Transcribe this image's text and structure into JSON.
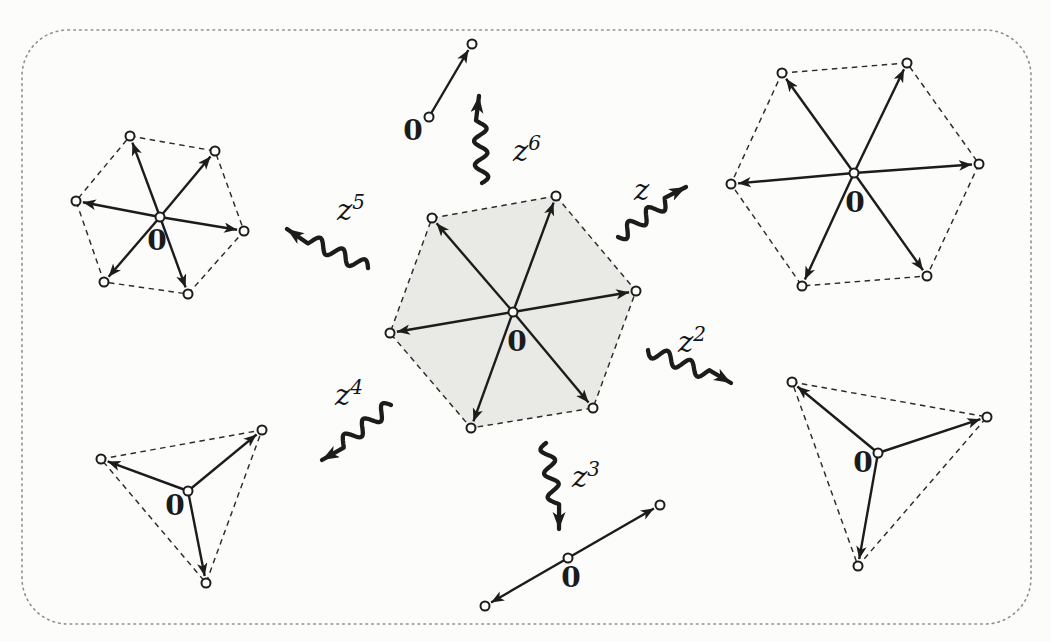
{
  "figure_title": "powers-of-z-mapping-diagram",
  "colors": {
    "page_background": "#fcfcfa",
    "ink": "#1c1c1c",
    "dash": "#2b2b2b",
    "border_dots": "#8f8f8f",
    "hexagon_shade": "#e9e9e6",
    "dot_fill": "#fcfcfa"
  },
  "border": {
    "x": 22,
    "y": 30,
    "width": 1009,
    "height": 594,
    "radius": 46
  },
  "shapes": [
    {
      "id": "domain-hexagon-shaded",
      "kind": "hexagon",
      "filled": true,
      "outline": true,
      "center": [
        513,
        312
      ],
      "zero": [
        517,
        351
      ],
      "zero_label": "0",
      "vertices": [
        [
          556,
          196
        ],
        [
          432,
          218
        ],
        [
          390,
          333
        ],
        [
          471,
          428
        ],
        [
          593,
          408
        ],
        [
          636,
          291
        ]
      ]
    },
    {
      "id": "image-hexagon-z",
      "kind": "hexagon",
      "filled": false,
      "outline": true,
      "center": [
        854,
        173
      ],
      "zero": [
        855,
        212
      ],
      "zero_label": "0",
      "vertices": [
        [
          782,
          73
        ],
        [
          907,
          63
        ],
        [
          979,
          164
        ],
        [
          927,
          276
        ],
        [
          802,
          286
        ],
        [
          731,
          184
        ]
      ]
    },
    {
      "id": "image-hexagon-z5",
      "kind": "hexagon",
      "filled": false,
      "outline": true,
      "center": [
        160,
        217
      ],
      "zero": [
        157,
        250
      ],
      "zero_label": "0",
      "vertices": [
        [
          130,
          136
        ],
        [
          215,
          151
        ],
        [
          244,
          231
        ],
        [
          188,
          294
        ],
        [
          104,
          282
        ],
        [
          76,
          201
        ]
      ]
    },
    {
      "id": "image-triangle-z4",
      "kind": "triangle",
      "filled": false,
      "outline": true,
      "center": [
        188,
        491
      ],
      "zero": [
        175,
        515
      ],
      "zero_label": "0",
      "vertices": [
        [
          101,
          459
        ],
        [
          262,
          430
        ],
        [
          206,
          583
        ]
      ]
    },
    {
      "id": "image-triangle-z2",
      "kind": "triangle",
      "filled": false,
      "outline": true,
      "center": [
        878,
        453
      ],
      "zero": [
        863,
        472
      ],
      "zero_label": "0",
      "vertices": [
        [
          792,
          382
        ],
        [
          987,
          417
        ],
        [
          858,
          566
        ]
      ]
    },
    {
      "id": "image-segment-z3",
      "kind": "segment",
      "filled": false,
      "outline": false,
      "center": [
        568,
        558
      ],
      "zero": [
        571,
        587
      ],
      "zero_label": "0",
      "vertices": [
        [
          660,
          505
        ],
        [
          485,
          606
        ]
      ]
    },
    {
      "id": "image-arrow-z6",
      "kind": "point",
      "filled": false,
      "outline": false,
      "center": [
        429,
        117
      ],
      "zero": [
        413,
        140
      ],
      "zero_label": "0",
      "vertices": [
        [
          472,
          44
        ]
      ]
    }
  ],
  "maps": [
    {
      "id": "map-arrow-z",
      "label": {
        "base": "z",
        "sup": "",
        "x": 634,
        "y": 200
      },
      "tail": [
        618,
        237
      ],
      "head": [
        686,
        187
      ],
      "waves": 2.6,
      "amp": 6.5
    },
    {
      "id": "map-arrow-z2",
      "label": {
        "base": "z",
        "sup": "2",
        "x": 678,
        "y": 352
      },
      "tail": [
        648,
        350
      ],
      "head": [
        731,
        383
      ],
      "waves": 2.6,
      "amp": 6.5
    },
    {
      "id": "map-arrow-z3",
      "label": {
        "base": "z",
        "sup": "3",
        "x": 572,
        "y": 487
      },
      "tail": [
        546,
        443
      ],
      "head": [
        559,
        529
      ],
      "waves": 2.6,
      "amp": 6.5
    },
    {
      "id": "map-arrow-z4",
      "label": {
        "base": "z",
        "sup": "4",
        "x": 335,
        "y": 405
      },
      "tail": [
        391,
        405
      ],
      "head": [
        322,
        460
      ],
      "waves": 2.6,
      "amp": 6.5
    },
    {
      "id": "map-arrow-z5",
      "label": {
        "base": "z",
        "sup": "5",
        "x": 337,
        "y": 220
      },
      "tail": [
        368,
        268
      ],
      "head": [
        287,
        229
      ],
      "waves": 2.6,
      "amp": 6.5
    },
    {
      "id": "map-arrow-z6",
      "label": {
        "base": "z",
        "sup": "6",
        "x": 513,
        "y": 161
      },
      "tail": [
        482,
        183
      ],
      "head": [
        479,
        96
      ],
      "waves": 2.6,
      "amp": 6.5
    }
  ],
  "style_numbers": {
    "vertex_dot_radius": 4.5,
    "radial_arrow_width": 2.4,
    "dash_pattern": "5.5 4.5",
    "squiggle_width": 4.3,
    "border_dot_pattern": "1.6 4.2",
    "arrow_pullback": 7
  }
}
